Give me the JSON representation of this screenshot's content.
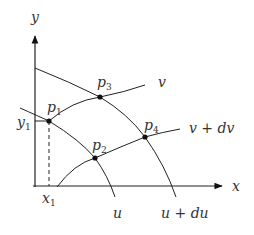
{
  "diagram": {
    "axes": {
      "x_label": "x",
      "y_label": "y"
    },
    "curves": {
      "u": "u",
      "u_du": "u + du",
      "v": "v",
      "v_dv": "v + dv"
    },
    "points": [
      {
        "name": "p",
        "sub": "1"
      },
      {
        "name": "p",
        "sub": "2"
      },
      {
        "name": "p",
        "sub": "3"
      },
      {
        "name": "p",
        "sub": "4"
      }
    ],
    "coordinates": {
      "x1": {
        "name": "x",
        "sub": "1"
      },
      "y1": {
        "name": "y",
        "sub": "1"
      }
    },
    "colors": {
      "line": "#222222",
      "text": "#333333"
    }
  }
}
